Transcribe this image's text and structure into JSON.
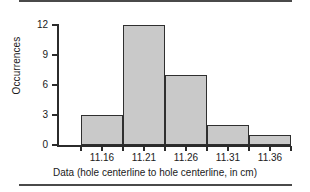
{
  "figure": {
    "top_rule": "horizontal-rule",
    "bottom_rule": "horizontal-rule"
  },
  "chart_data": {
    "type": "bar",
    "title": "",
    "xlabel": "Data (hole centerline to hole centerline, in cm)",
    "ylabel": "Occurrences",
    "categories": [
      "11.16",
      "11.21",
      "11.26",
      "11.31",
      "11.36"
    ],
    "values": [
      3,
      12,
      7,
      2,
      1
    ],
    "ylim": [
      0,
      12
    ],
    "yticks": [
      "0",
      "3",
      "6",
      "9",
      "12"
    ],
    "ytick_values": [
      0,
      3,
      6,
      9,
      12
    ],
    "grid": false,
    "legend": null,
    "bar_fill_color": "#c9c9c9",
    "bar_edge_color": "#2f2f2f",
    "axis_color": "#2b2b2b"
  }
}
